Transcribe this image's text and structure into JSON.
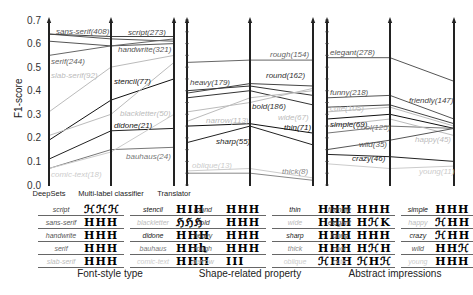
{
  "chart_data": {
    "type": "parallel-coordinates",
    "ylabel": "F1-score",
    "ylim": [
      0.0,
      0.7
    ],
    "yticks": [
      "0.0",
      "0.1",
      "0.2",
      "0.3",
      "0.4",
      "0.5",
      "0.6",
      "0.7"
    ],
    "axes": [
      "DeepSets",
      "Multi-label classifier",
      "Translator"
    ],
    "panels": [
      {
        "title": "Font-style type",
        "series": [
          {
            "name": "sans-serif",
            "count": 408,
            "label": "sans-serif(408)",
            "values": [
              0.64,
              0.62,
              0.61
            ],
            "shade": "#555555",
            "label_at": 0,
            "label_y": 0.655,
            "label_x": 56
          },
          {
            "name": "script",
            "count": 273,
            "label": "script(273)",
            "values": [
              0.64,
              0.63,
              0.63
            ],
            "shade": "#444444",
            "label_at": 2,
            "label_y": 0.65,
            "label_x": 128
          },
          {
            "name": "handwrite",
            "count": 321,
            "label": "handwrite(321)",
            "values": [
              0.61,
              0.59,
              0.6
            ],
            "shade": "#555555",
            "label_at": 2,
            "label_y": 0.575,
            "label_x": 118
          },
          {
            "name": "serif",
            "count": 244,
            "label": "serif(244)",
            "values": [
              0.55,
              0.59,
              0.62
            ],
            "shade": "#666666",
            "label_at": 0,
            "label_y": 0.525,
            "label_x": 51
          },
          {
            "name": "slab-serif",
            "count": 92,
            "label": "slab-serif(92)",
            "values": [
              0.31,
              0.5,
              0.55
            ],
            "shade": "#bbbbbb",
            "label_at": 0,
            "label_y": 0.465,
            "label_x": 51
          },
          {
            "name": "stencil",
            "count": 77,
            "label": "stencil(77)",
            "values": [
              0.19,
              0.36,
              0.45
            ],
            "shade": "#111111",
            "label_at": 1,
            "label_y": 0.44,
            "label_x": 114
          },
          {
            "name": "blackletter",
            "count": 50,
            "label": "blackletter(50)",
            "values": [
              0.21,
              0.3,
              0.52
            ],
            "shade": "#bbbbbb",
            "label_at": 1,
            "label_y": 0.305,
            "label_x": 120
          },
          {
            "name": "didone",
            "count": 21,
            "label": "didone(21)",
            "values": [
              0.11,
              0.23,
              0.24
            ],
            "shade": "#222222",
            "label_at": 1,
            "label_y": 0.255,
            "label_x": 114
          },
          {
            "name": "bauhaus",
            "count": 24,
            "label": "bauhaus(24)",
            "values": [
              0.07,
              0.15,
              0.16
            ],
            "shade": "#777777",
            "label_at": 2,
            "label_y": 0.125,
            "label_x": 126
          },
          {
            "name": "comic-text",
            "count": 18,
            "label": "comic-text(18)",
            "values": [
              0.07,
              0.14,
              0.3
            ],
            "shade": "#cccccc",
            "label_at": 0,
            "label_y": 0.045,
            "label_x": 51
          }
        ]
      },
      {
        "title": "Shape-related property",
        "series": [
          {
            "name": "rough",
            "count": 154,
            "label": "rough(154)",
            "values": [
              0.52,
              0.53,
              0.53
            ],
            "shade": "#666666",
            "label_at": 2,
            "label_y": 0.555,
            "label_x": 270
          },
          {
            "name": "heavy",
            "count": 179,
            "label": "heavy(179)",
            "values": [
              0.39,
              0.43,
              0.42
            ],
            "shade": "#444444",
            "label_at": 0,
            "label_y": 0.435,
            "label_x": 190
          },
          {
            "name": "round",
            "count": 162,
            "label": "round(162)",
            "values": [
              0.4,
              0.42,
              0.38
            ],
            "shade": "#333333",
            "label_at": 2,
            "label_y": 0.465,
            "label_x": 266
          },
          {
            "name": "bold",
            "count": 186,
            "label": "bold(186)",
            "values": [
              0.37,
              0.4,
              0.34
            ],
            "shade": "#333333",
            "label_at": 1,
            "label_y": 0.335,
            "label_x": 252
          },
          {
            "name": "wide",
            "count": 67,
            "label": "wide(67)",
            "values": [
              0.31,
              0.35,
              0.41
            ],
            "shade": "#bbbbbb",
            "label_at": 1,
            "label_y": 0.29,
            "label_x": 278
          },
          {
            "name": "narrow",
            "count": 113,
            "label": "narrow(113)",
            "values": [
              0.27,
              0.37,
              0.4
            ],
            "shade": "#bbbbbb",
            "label_at": 0,
            "label_y": 0.275,
            "label_x": 206
          },
          {
            "name": "thin",
            "count": 71,
            "label": "thin(71)",
            "values": [
              0.25,
              0.26,
              0.22
            ],
            "shade": "#111111",
            "label_at": 2,
            "label_y": 0.245,
            "label_x": 284
          },
          {
            "name": "sharp",
            "count": 55,
            "label": "sharp(55)",
            "values": [
              0.18,
              0.25,
              0.17
            ],
            "shade": "#222222",
            "label_at": 0,
            "label_y": 0.185,
            "label_x": 216
          },
          {
            "name": "oblique",
            "count": 13,
            "label": "oblique(13)",
            "values": [
              0.06,
              0.07,
              0.03
            ],
            "shade": "#cccccc",
            "label_at": 0,
            "label_y": 0.085,
            "label_x": 192
          },
          {
            "name": "thick",
            "count": 8,
            "label": "thick(8)",
            "values": [
              0.05,
              0.05,
              0.02
            ],
            "shade": "#888888",
            "label_at": 2,
            "label_y": 0.06,
            "label_x": 282
          }
        ]
      },
      {
        "title": "Abstract impressions",
        "series": [
          {
            "name": "elegant",
            "count": 278,
            "label": "elegant(278)",
            "values": [
              0.54,
              0.54,
              0.44
            ],
            "shade": "#555555",
            "label_at": 0,
            "label_y": 0.565,
            "label_x": 330
          },
          {
            "name": "funny",
            "count": 218,
            "label": "funny(218)",
            "values": [
              0.37,
              0.38,
              0.28
            ],
            "shade": "#555555",
            "label_at": 0,
            "label_y": 0.395,
            "label_x": 330
          },
          {
            "name": "friendly",
            "count": 147,
            "label": "friendly(147)",
            "values": [
              0.33,
              0.34,
              0.26
            ],
            "shade": "#444444",
            "label_at": 2,
            "label_y": 0.36,
            "label_x": 409
          },
          {
            "name": "cute",
            "count": 105,
            "label": "cute(105)",
            "values": [
              0.31,
              0.33,
              0.25
            ],
            "shade": "#bbbbbb",
            "label_at": 0,
            "label_y": 0.325,
            "label_x": 330
          },
          {
            "name": "simple",
            "count": 69,
            "label": "simple(69)",
            "values": [
              0.28,
              0.3,
              0.24
            ],
            "shade": "#111111",
            "label_at": 0,
            "label_y": 0.26,
            "label_x": 330
          },
          {
            "name": "cool",
            "count": 125,
            "label": "cool(125)",
            "values": [
              0.22,
              0.25,
              0.24
            ],
            "shade": "#777777",
            "label_at": 1,
            "label_y": 0.245,
            "label_x": 357
          },
          {
            "name": "happy",
            "count": 45,
            "label": "happy(45)",
            "values": [
              0.25,
              0.28,
              0.21
            ],
            "shade": "#bbbbbb",
            "label_at": 2,
            "label_y": 0.195,
            "label_x": 415
          },
          {
            "name": "wild",
            "count": 35,
            "label": "wild(35)",
            "values": [
              0.15,
              0.19,
              0.24
            ],
            "shade": "#555555",
            "label_at": 1,
            "label_y": 0.175,
            "label_x": 359
          },
          {
            "name": "crazy",
            "count": 46,
            "label": "crazy(46)",
            "values": [
              0.13,
              0.12,
              0.1
            ],
            "shade": "#222222",
            "label_at": 1,
            "label_y": 0.115,
            "label_x": 352
          },
          {
            "name": "young",
            "count": 11,
            "label": "young(11)",
            "values": [
              0.09,
              0.07,
              0.08
            ],
            "shade": "#cccccc",
            "label_at": 2,
            "label_y": 0.06,
            "label_x": 419
          }
        ]
      }
    ]
  },
  "legend": {
    "font_style": {
      "title": "Font-style type",
      "left": [
        {
          "name": "script",
          "glyphs": "ℋℋℋ"
        },
        {
          "name": "sans-serif",
          "glyphs": "HHH"
        },
        {
          "name": "handwrite",
          "glyphs": "HHH"
        },
        {
          "name": "serif",
          "glyphs": "HHH"
        },
        {
          "name": "slab-serif",
          "glyphs": "HHH"
        }
      ],
      "right": [
        {
          "name": "stencil",
          "glyphs": "HIH"
        },
        {
          "name": "blackletter",
          "glyphs": "ℌℌℌ"
        },
        {
          "name": "didone",
          "glyphs": "HHH"
        },
        {
          "name": "bauhaus",
          "glyphs": "HHh"
        },
        {
          "name": "comic-text",
          "glyphs": "HHH"
        }
      ]
    },
    "shape": {
      "title": "Shape-related property",
      "left": [
        {
          "name": "round",
          "glyphs": "HHH"
        },
        {
          "name": "bold",
          "glyphs": "HHH"
        },
        {
          "name": "heavy",
          "glyphs": "HHH"
        },
        {
          "name": "rough",
          "glyphs": "HHH"
        },
        {
          "name": "narrow",
          "glyphs": "ӀӀӀ"
        }
      ],
      "right": [
        {
          "name": "thin",
          "glyphs": "HHH"
        },
        {
          "name": "wide",
          "glyphs": "HHH"
        },
        {
          "name": "sharp",
          "glyphs": "HHH"
        },
        {
          "name": "thick",
          "glyphs": "HHH"
        },
        {
          "name": "oblique",
          "glyphs": "ℋHH"
        }
      ]
    },
    "abstract": {
      "title": "Abstract impressions",
      "left": [
        {
          "name": "friendly",
          "glyphs": "HHH"
        },
        {
          "name": "elegant",
          "glyphs": "HℋK"
        },
        {
          "name": "funny",
          "glyphs": "HHH"
        },
        {
          "name": "cool",
          "glyphs": "HℋH"
        },
        {
          "name": "cute",
          "glyphs": "ℋHℋ"
        }
      ],
      "right": [
        {
          "name": "simple",
          "glyphs": "HHH"
        },
        {
          "name": "happy",
          "glyphs": "ℋHH"
        },
        {
          "name": "crazy",
          "glyphs": "ℋHH"
        },
        {
          "name": "wild",
          "glyphs": "HHℋ"
        },
        {
          "name": "young",
          "glyphs": "HHH"
        }
      ]
    }
  }
}
